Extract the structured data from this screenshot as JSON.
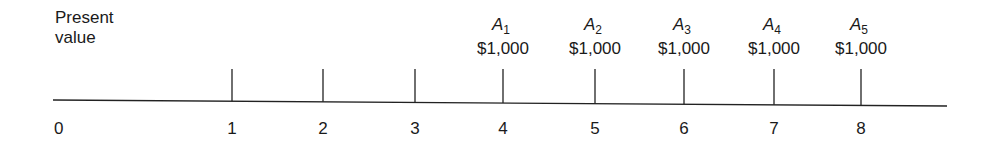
{
  "diagram": {
    "type": "cash-flow-timeline",
    "origin_label": "Present value",
    "periods": [
      "0",
      "1",
      "2",
      "3",
      "4",
      "5",
      "6",
      "7",
      "8"
    ],
    "payments": [
      {
        "period": 4,
        "label": "A",
        "subscript": "1",
        "amount": "$1,000"
      },
      {
        "period": 5,
        "label": "A",
        "subscript": "2",
        "amount": "$1,000"
      },
      {
        "period": 6,
        "label": "A",
        "subscript": "3",
        "amount": "$1,000"
      },
      {
        "period": 7,
        "label": "A",
        "subscript": "4",
        "amount": "$1,000"
      },
      {
        "period": 8,
        "label": "A",
        "subscript": "5",
        "amount": "$1,000"
      }
    ]
  }
}
